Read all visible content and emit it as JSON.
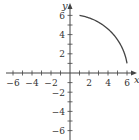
{
  "chart_data": {
    "type": "line",
    "title": "",
    "xlabel": "x",
    "ylabel": "y",
    "xlim": [
      -6.5,
      7
    ],
    "ylim": [
      -6.8,
      6.8
    ],
    "xticks": [
      -6,
      -5,
      -4,
      -3,
      -2,
      -1,
      1,
      2,
      3,
      4,
      5,
      6
    ],
    "yticks": [
      -6,
      -5,
      -4,
      -3,
      -2,
      -1,
      1,
      2,
      3,
      4,
      5,
      6
    ],
    "x_tick_labels": [
      "-6",
      "-4",
      "-2",
      "2",
      "4",
      "6"
    ],
    "y_tick_labels": [
      "6",
      "4",
      "2",
      "-2",
      "-4",
      "-6"
    ],
    "grid": false,
    "series": [
      {
        "name": "curve",
        "description": "arc of x^2 + y^2 = 37 in the first quadrant",
        "x": [
          1,
          2,
          3,
          4,
          5,
          5.5,
          6
        ],
        "y": [
          6,
          5.74,
          5.29,
          4.58,
          3.46,
          2.6,
          1
        ]
      }
    ]
  },
  "labels": {
    "x_axis": "x",
    "y_axis": "y",
    "x_ticks": [
      "−6",
      "−4",
      "−2",
      "2",
      "4",
      "6"
    ],
    "y_ticks": [
      "6",
      "4",
      "2",
      "−2",
      "−4",
      "−6"
    ]
  }
}
